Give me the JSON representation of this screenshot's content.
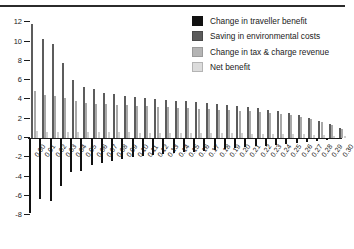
{
  "chart_data": {
    "type": "bar",
    "title": "",
    "xlabel": "",
    "ylabel": "",
    "ylim": [
      -8,
      12
    ],
    "yticks": [
      12,
      10,
      8,
      6,
      4,
      2,
      0,
      -2,
      -4,
      -6,
      -8
    ],
    "grid": false,
    "legend_position": "top-right",
    "categories": [
      "0.00",
      "0.01",
      "0.02",
      "0.03",
      "0.04",
      "0.05",
      "0.06",
      "0.07",
      "0.08",
      "0.09",
      "0.10",
      "0.11",
      "0.12",
      "0.13",
      "0.14",
      "0.15",
      "0.16",
      "0.17",
      "0.18",
      "0.19",
      "0.20",
      "0.21",
      "0.22",
      "0.23",
      "0.24",
      "0.25",
      "0.26",
      "0.27",
      "0.28",
      "0.29",
      "0.30"
    ],
    "series": [
      {
        "name": "Change in traveller benefit",
        "color": "#111111",
        "values": [
          -7.8,
          -6.3,
          -6.5,
          -5.0,
          -3.5,
          -3.4,
          -2.8,
          -2.6,
          -2.4,
          -2.2,
          -2.0,
          -1.9,
          -1.8,
          -1.7,
          -1.6,
          -1.5,
          -1.4,
          -1.3,
          -1.2,
          -1.1,
          -1.0,
          -0.9,
          -0.85,
          -0.8,
          -0.7,
          -0.6,
          -0.5,
          -0.45,
          -0.35,
          -0.25,
          -0.15
        ]
      },
      {
        "name": "Saving in environmental costs",
        "color": "#5c5c5c",
        "values": [
          11.8,
          10.3,
          9.7,
          7.8,
          6.0,
          5.3,
          5.1,
          4.7,
          4.6,
          4.4,
          4.2,
          4.1,
          4.0,
          3.9,
          3.8,
          3.8,
          3.7,
          3.6,
          3.5,
          3.4,
          3.3,
          3.2,
          3.1,
          2.9,
          2.8,
          2.6,
          2.4,
          2.1,
          1.8,
          1.4,
          1.0
        ]
      },
      {
        "name": "Change in tax & charge revenue",
        "color": "#a8a8a8",
        "values": [
          4.9,
          4.5,
          4.4,
          4.1,
          3.8,
          3.6,
          3.5,
          3.5,
          3.4,
          3.4,
          3.3,
          3.3,
          3.2,
          3.2,
          3.1,
          3.1,
          3.0,
          3.0,
          2.9,
          2.9,
          2.8,
          2.8,
          2.7,
          2.6,
          2.5,
          2.4,
          2.2,
          2.0,
          1.7,
          1.3,
          0.9
        ]
      },
      {
        "name": "Net benefit",
        "color": "#cfcfcf",
        "values": [
          0.7,
          0.6,
          0.6,
          0.6,
          0.6,
          0.6,
          0.6,
          0.6,
          0.6,
          0.6,
          0.5,
          0.5,
          0.5,
          0.5,
          0.5,
          0.5,
          0.5,
          0.5,
          0.5,
          0.5,
          0.5,
          0.4,
          0.4,
          0.4,
          0.4,
          0.4,
          0.4,
          0.3,
          0.3,
          0.2,
          0.2
        ]
      }
    ]
  },
  "legend": {
    "items": [
      {
        "label": "Change in traveller benefit"
      },
      {
        "label": "Saving in environmental costs"
      },
      {
        "label": "Change in tax & charge revenue"
      },
      {
        "label": "Net benefit"
      }
    ]
  }
}
